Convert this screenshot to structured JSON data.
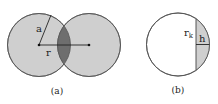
{
  "figure_a": {
    "label": "(a)",
    "radius_label": "a",
    "distance_label": "r",
    "colors": {
      "circle_fill": "#cfcfcf",
      "overlap_fill": "#6e6e6e",
      "stroke": "#666666"
    }
  },
  "figure_b": {
    "label": "(b)",
    "radius_label": "r",
    "radius_subscript": "k",
    "height_label": "h",
    "colors": {
      "circle_fill": "#ffffff",
      "cap_fill": "#cfcfcf",
      "stroke": "#666666"
    }
  }
}
